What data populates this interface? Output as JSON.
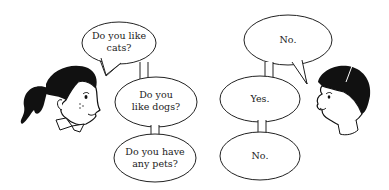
{
  "girl": {
    "label": "girl",
    "questions": [
      {
        "text_line1": "Do you like",
        "text_line2": "cats?"
      },
      {
        "text_line1": "Do you",
        "text_line2": "like dogs?"
      },
      {
        "text_line1": "Do you have",
        "text_line2": "any pets?"
      }
    ]
  },
  "boy": {
    "label": "boy",
    "answers": [
      {
        "text": "No."
      },
      {
        "text": "Yes."
      },
      {
        "text": "No."
      }
    ]
  },
  "colors": {
    "ink": "#1a1a1a",
    "background": "#ffffff"
  }
}
